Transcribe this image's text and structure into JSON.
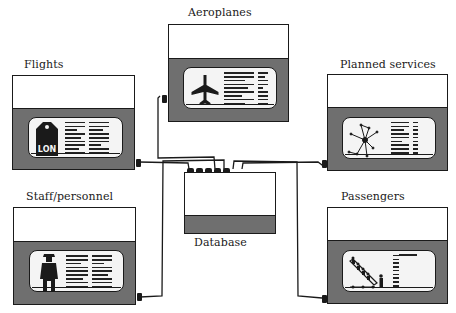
{
  "diagram": {
    "type": "hub-and-spoke",
    "central_node": {
      "label": "Database"
    },
    "nodes": [
      {
        "id": "aeroplanes",
        "label": "Aeroplanes",
        "icon": "aeroplane-icon"
      },
      {
        "id": "flights",
        "label": "Flights",
        "icon": "luggage-tag-icon",
        "icon_text": "LON"
      },
      {
        "id": "planned_services",
        "label": "Planned services",
        "icon": "route-network-icon"
      },
      {
        "id": "staff",
        "label": "Staff/personnel",
        "icon": "pilot-figure-icon"
      },
      {
        "id": "passengers",
        "label": "Passengers",
        "icon": "boarding-stairs-icon"
      }
    ],
    "edges": [
      {
        "from": "aeroplanes",
        "to": "database"
      },
      {
        "from": "flights",
        "to": "database"
      },
      {
        "from": "planned_services",
        "to": "database"
      },
      {
        "from": "staff",
        "to": "database"
      },
      {
        "from": "passengers",
        "to": "database"
      }
    ]
  },
  "colors": {
    "ink": "#1a1a1a",
    "panel_gray": "#6f6f6f",
    "screen": "#f4f4f4",
    "background": "#ffffff"
  }
}
